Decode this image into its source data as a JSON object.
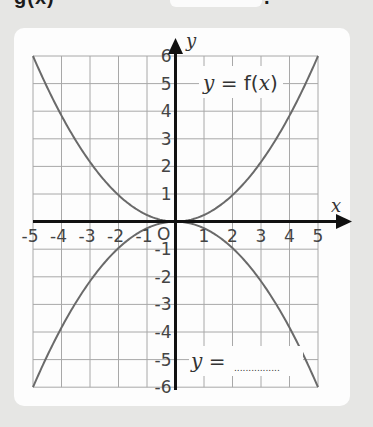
{
  "header": {
    "partial_text": "g(x)",
    "trailing_text": "."
  },
  "chart_data": {
    "type": "line",
    "title": "",
    "xlabel": "x",
    "ylabel": "y",
    "xlim": [
      -5,
      5
    ],
    "ylim": [
      -6,
      6
    ],
    "grid": true,
    "origin_label": "O",
    "x_ticks": [
      -5,
      -4,
      -3,
      -2,
      -1,
      1,
      2,
      3,
      4,
      5
    ],
    "y_ticks": [
      -6,
      -5,
      -4,
      -3,
      -2,
      -1,
      1,
      2,
      3,
      4,
      5,
      6
    ],
    "series": [
      {
        "name": "y = f(x)",
        "x": [
          -5,
          -4,
          -3,
          -2,
          -1,
          0,
          1,
          2,
          3,
          4,
          5
        ],
        "y": [
          6,
          3.84,
          2.16,
          0.96,
          0.24,
          0,
          0.24,
          0.96,
          2.16,
          3.84,
          6
        ]
      },
      {
        "name": "y = ......",
        "x": [
          -5,
          -4,
          -3,
          -2,
          -1,
          0,
          1,
          2,
          3,
          4,
          5
        ],
        "y": [
          -6,
          -3.84,
          -2.16,
          -0.96,
          -0.24,
          0,
          -0.24,
          -0.96,
          -2.16,
          -3.84,
          -6
        ]
      }
    ],
    "annotations": [
      {
        "text": "y = f(x)",
        "near": [
          3,
          5
        ]
      },
      {
        "text": "y = ..............",
        "near": [
          2.5,
          -5
        ]
      }
    ]
  },
  "labels": {
    "upper_eq_y": "y",
    "upper_eq_rest": " = f(",
    "upper_eq_x": "x",
    "upper_eq_close": ")",
    "lower_eq_y": "y",
    "lower_eq_rest": " =",
    "lower_eq_blank": "................",
    "axis_x": "x",
    "axis_y": "y",
    "origin": "O"
  },
  "colors": {
    "background": "#e6e6e4",
    "card": "#fdfdfd",
    "grid": "#a8a8a8",
    "axis": "#111111",
    "curve": "#6a6a6a"
  }
}
